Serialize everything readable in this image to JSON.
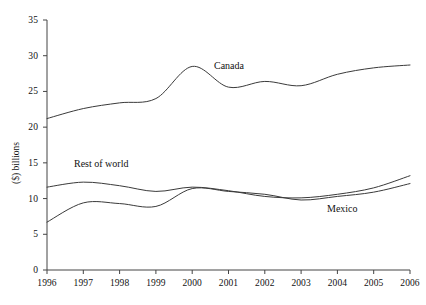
{
  "chart_data": {
    "type": "line",
    "title": "",
    "xlabel": "",
    "ylabel": "($) billions",
    "xlim": [
      1996,
      2006
    ],
    "ylim": [
      0,
      35
    ],
    "ytick_step": 5,
    "grid": false,
    "legend": "inline-annotations",
    "x": [
      1996,
      1997,
      1998,
      1999,
      2000,
      2001,
      2002,
      2003,
      2004,
      2005,
      2006
    ],
    "xtick_labels": [
      "1996",
      "1997",
      "1998",
      "1999",
      "2000",
      "2001",
      "2002",
      "2003",
      "2004",
      "2005",
      "2006"
    ],
    "ytick_labels": [
      "0",
      "5",
      "10",
      "15",
      "20",
      "25",
      "30",
      "35"
    ],
    "series": [
      {
        "name": "Canada",
        "values": [
          21.2,
          22.6,
          23.4,
          24.0,
          28.5,
          25.6,
          26.4,
          25.8,
          27.4,
          28.3,
          28.7
        ],
        "color": "#3a3a3a"
      },
      {
        "name": "Rest of world",
        "values": [
          11.6,
          12.3,
          11.8,
          11.0,
          11.6,
          11.1,
          10.3,
          10.1,
          10.6,
          11.5,
          13.2
        ],
        "color": "#3a3a3a"
      },
      {
        "name": "Mexico",
        "values": [
          6.7,
          9.4,
          9.3,
          8.9,
          11.4,
          11.0,
          10.6,
          9.8,
          10.3,
          10.9,
          12.1
        ],
        "color": "#3a3a3a"
      }
    ],
    "annotations": [
      {
        "text": "Canada",
        "x": 2001.0,
        "y": 29.5
      },
      {
        "text": "Rest of world",
        "x": 1996.8,
        "y": 15.6
      },
      {
        "text": "Mexico",
        "x": 2004.0,
        "y": 9.4
      }
    ]
  },
  "axis": {
    "y_title": "($) billions"
  }
}
